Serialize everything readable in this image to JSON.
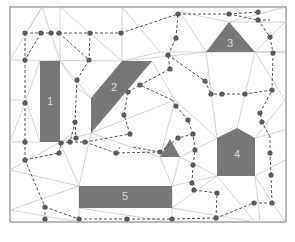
{
  "diagram": {
    "frame": {
      "x": 10,
      "y": 7,
      "w": 276,
      "h": 215
    },
    "colors": {
      "obstacle": "#777777",
      "mesh": "#c9c9c9",
      "path": "#555555",
      "node": "#5a5a5a",
      "label": "#d8d8d8",
      "frame": "#8a8a8a"
    },
    "obstacles": [
      {
        "id": "1",
        "label": "1",
        "points": "40,61 60,61 60,142 40,142",
        "label_x": 50,
        "label_y": 102
      },
      {
        "id": "2",
        "label": "2",
        "points": "122,61 152,61 91,133 91,98",
        "label_x": 114,
        "label_y": 88
      },
      {
        "id": "3",
        "label": "3",
        "points": "206,52 229,22 255,52",
        "label_x": 230,
        "label_y": 44
      },
      {
        "id": "4",
        "label": "4",
        "points": "217,138 237,128 255,138 255,176 217,176",
        "label_x": 237,
        "label_y": 155
      },
      {
        "id": "5",
        "label": "5",
        "points": "79,186 172,186 172,208 79,208",
        "label_x": 125,
        "label_y": 197
      },
      {
        "id": "small-triangle",
        "label": "",
        "points": "160,157 170,139 180,157",
        "label_x": 170,
        "label_y": 150
      }
    ],
    "mesh_lines": [
      [
        10,
        60,
        122,
        61
      ],
      [
        122,
        61,
        206,
        52
      ],
      [
        206,
        52,
        285,
        52
      ],
      [
        255,
        52,
        285,
        52
      ],
      [
        10,
        60,
        42,
        7
      ],
      [
        42,
        7,
        60,
        61
      ],
      [
        42,
        7,
        26,
        33
      ],
      [
        42,
        7,
        60,
        7
      ],
      [
        60,
        7,
        60,
        61
      ],
      [
        60,
        7,
        122,
        61
      ],
      [
        122,
        7,
        122,
        61
      ],
      [
        122,
        7,
        160,
        52
      ],
      [
        122,
        61,
        160,
        52
      ],
      [
        160,
        52,
        206,
        52
      ],
      [
        229,
        22,
        285,
        7
      ],
      [
        229,
        22,
        180,
        12
      ],
      [
        180,
        12,
        206,
        52
      ],
      [
        285,
        22,
        255,
        52
      ],
      [
        229,
        22,
        285,
        22
      ],
      [
        10,
        142,
        40,
        142
      ],
      [
        10,
        142,
        26,
        100
      ],
      [
        26,
        100,
        40,
        61
      ],
      [
        26,
        100,
        40,
        142
      ],
      [
        10,
        100,
        26,
        100
      ],
      [
        60,
        142,
        91,
        133
      ],
      [
        60,
        142,
        80,
        130
      ],
      [
        91,
        133,
        152,
        61
      ],
      [
        60,
        61,
        91,
        98
      ],
      [
        60,
        61,
        80,
        90
      ],
      [
        80,
        90,
        91,
        98
      ],
      [
        152,
        61,
        175,
        100
      ],
      [
        175,
        100,
        217,
        138
      ],
      [
        206,
        52,
        217,
        138
      ],
      [
        255,
        52,
        237,
        128
      ],
      [
        255,
        52,
        285,
        100
      ],
      [
        91,
        133,
        175,
        100
      ],
      [
        91,
        133,
        160,
        157
      ],
      [
        175,
        100,
        160,
        157
      ],
      [
        60,
        142,
        79,
        186
      ],
      [
        79,
        186,
        91,
        133
      ],
      [
        10,
        170,
        60,
        142
      ],
      [
        10,
        170,
        79,
        186
      ],
      [
        10,
        210,
        79,
        186
      ],
      [
        10,
        210,
        79,
        222
      ],
      [
        79,
        186,
        79,
        222
      ],
      [
        160,
        157,
        172,
        186
      ],
      [
        180,
        157,
        172,
        186
      ],
      [
        180,
        157,
        217,
        176
      ],
      [
        180,
        157,
        217,
        138
      ],
      [
        172,
        186,
        217,
        176
      ],
      [
        172,
        208,
        217,
        176
      ],
      [
        172,
        208,
        255,
        222
      ],
      [
        217,
        176,
        255,
        222
      ],
      [
        255,
        176,
        285,
        160
      ],
      [
        255,
        138,
        285,
        130
      ],
      [
        255,
        176,
        260,
        222
      ],
      [
        255,
        176,
        285,
        222
      ],
      [
        172,
        186,
        172,
        222
      ],
      [
        79,
        208,
        172,
        222
      ],
      [
        285,
        100,
        255,
        138
      ]
    ],
    "path_edges": [
      [
        25,
        33,
        41,
        33
      ],
      [
        41,
        33,
        51,
        33
      ],
      [
        51,
        33,
        59,
        33
      ],
      [
        59,
        33,
        90,
        33
      ],
      [
        90,
        33,
        121,
        33
      ],
      [
        121,
        33,
        178,
        14
      ],
      [
        178,
        14,
        229,
        14
      ],
      [
        229,
        14,
        258,
        12
      ],
      [
        258,
        12,
        258,
        20
      ],
      [
        229,
        14,
        258,
        20
      ],
      [
        25,
        33,
        25,
        60
      ],
      [
        41,
        33,
        25,
        60
      ],
      [
        59,
        33,
        89,
        60
      ],
      [
        90,
        33,
        89,
        60
      ],
      [
        89,
        60,
        77,
        80
      ],
      [
        77,
        80,
        75,
        122
      ],
      [
        25,
        60,
        25,
        103
      ],
      [
        25,
        103,
        25,
        142
      ],
      [
        25,
        142,
        25,
        160
      ],
      [
        25,
        160,
        59,
        153
      ],
      [
        59,
        153,
        61,
        143
      ],
      [
        61,
        143,
        70,
        142
      ],
      [
        70,
        142,
        85,
        142
      ],
      [
        85,
        142,
        116,
        153
      ],
      [
        85,
        142,
        130,
        134
      ],
      [
        130,
        134,
        124,
        115
      ],
      [
        124,
        115,
        128,
        92
      ],
      [
        128,
        92,
        140,
        85
      ],
      [
        140,
        85,
        170,
        69
      ],
      [
        170,
        69,
        168,
        55
      ],
      [
        168,
        55,
        176,
        38
      ],
      [
        176,
        38,
        178,
        14
      ],
      [
        168,
        55,
        205,
        81
      ],
      [
        205,
        81,
        210,
        84
      ],
      [
        258,
        20,
        270,
        37
      ],
      [
        270,
        37,
        273,
        53
      ],
      [
        273,
        53,
        272,
        90
      ],
      [
        272,
        90,
        245,
        94
      ],
      [
        245,
        94,
        222,
        94
      ],
      [
        222,
        94,
        212,
        94
      ],
      [
        212,
        94,
        211,
        94
      ],
      [
        205,
        81,
        211,
        94
      ],
      [
        258,
        20,
        270,
        20
      ],
      [
        75,
        122,
        76,
        138
      ],
      [
        75,
        122,
        70,
        142
      ],
      [
        25,
        160,
        45,
        207
      ],
      [
        45,
        207,
        45,
        219
      ],
      [
        45,
        207,
        79,
        219
      ],
      [
        79,
        219,
        127,
        219
      ],
      [
        127,
        219,
        172,
        219
      ],
      [
        172,
        219,
        216,
        218
      ],
      [
        216,
        218,
        254,
        203
      ],
      [
        254,
        203,
        272,
        203
      ],
      [
        272,
        203,
        271,
        175
      ],
      [
        271,
        175,
        270,
        153
      ],
      [
        270,
        153,
        270,
        137
      ],
      [
        270,
        137,
        262,
        122
      ],
      [
        262,
        122,
        260,
        113
      ],
      [
        216,
        218,
        217,
        193
      ],
      [
        217,
        193,
        194,
        190
      ],
      [
        194,
        190,
        192,
        183
      ],
      [
        192,
        183,
        193,
        165
      ],
      [
        193,
        165,
        195,
        150
      ],
      [
        195,
        150,
        193,
        134
      ],
      [
        193,
        134,
        178,
        138
      ],
      [
        178,
        138,
        160,
        152
      ],
      [
        160,
        152,
        116,
        153
      ],
      [
        193,
        134,
        188,
        120
      ],
      [
        188,
        120,
        176,
        106
      ],
      [
        176,
        106,
        172,
        100
      ],
      [
        172,
        100,
        140,
        85
      ],
      [
        260,
        113,
        272,
        90
      ],
      [
        116,
        153,
        120,
        147
      ],
      [
        133,
        147,
        160,
        152
      ]
    ],
    "nodes": [
      [
        25,
        33
      ],
      [
        41,
        33
      ],
      [
        51,
        33
      ],
      [
        59,
        33
      ],
      [
        90,
        33
      ],
      [
        121,
        33
      ],
      [
        178,
        14
      ],
      [
        229,
        14
      ],
      [
        258,
        12
      ],
      [
        258,
        20
      ],
      [
        25,
        60
      ],
      [
        89,
        60
      ],
      [
        77,
        80
      ],
      [
        25,
        103
      ],
      [
        75,
        122
      ],
      [
        25,
        142
      ],
      [
        25,
        160
      ],
      [
        59,
        153
      ],
      [
        61,
        143
      ],
      [
        70,
        142
      ],
      [
        85,
        142
      ],
      [
        116,
        153
      ],
      [
        130,
        134
      ],
      [
        124,
        115
      ],
      [
        128,
        92
      ],
      [
        140,
        85
      ],
      [
        170,
        69
      ],
      [
        168,
        55
      ],
      [
        176,
        38
      ],
      [
        205,
        81
      ],
      [
        270,
        37
      ],
      [
        273,
        53
      ],
      [
        272,
        90
      ],
      [
        245,
        94
      ],
      [
        222,
        94
      ],
      [
        211,
        94
      ],
      [
        45,
        207
      ],
      [
        45,
        219
      ],
      [
        79,
        219
      ],
      [
        127,
        219
      ],
      [
        172,
        219
      ],
      [
        216,
        218
      ],
      [
        254,
        203
      ],
      [
        272,
        203
      ],
      [
        271,
        175
      ],
      [
        270,
        153
      ],
      [
        262,
        122
      ],
      [
        260,
        113
      ],
      [
        217,
        193
      ],
      [
        194,
        190
      ],
      [
        192,
        183
      ],
      [
        193,
        165
      ],
      [
        195,
        150
      ],
      [
        193,
        134
      ],
      [
        178,
        138
      ],
      [
        160,
        152
      ],
      [
        188,
        120
      ],
      [
        176,
        106
      ],
      [
        76,
        138
      ]
    ]
  }
}
